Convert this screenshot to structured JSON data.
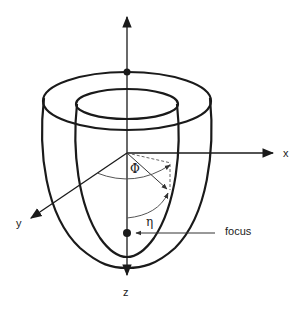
{
  "diagram": {
    "type": "prolate spheroidal coordinate system (nested shells)",
    "axes": {
      "x": {
        "label": "x"
      },
      "y": {
        "label": "y"
      },
      "z": {
        "label": "z"
      }
    },
    "angles": {
      "phi": {
        "label": "Φ"
      },
      "eta": {
        "label": "η"
      }
    },
    "annotations": {
      "focus": {
        "label": "focus"
      }
    },
    "colors": {
      "stroke": "#1a1a1a",
      "thin_stroke": "#555555",
      "background": "#ffffff"
    }
  }
}
